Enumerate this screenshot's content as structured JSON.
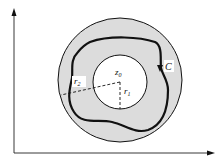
{
  "diagram": {
    "type": "annulus-contour",
    "labels": {
      "center": "z",
      "center_sub": "0",
      "inner_radius": "r",
      "inner_radius_sub": "1",
      "outer_radius": "r",
      "outer_radius_sub": "2",
      "contour": "C"
    },
    "colors": {
      "annulus_fill": "#dcdcdc",
      "inner_fill": "#ffffff",
      "stroke": "#111111"
    },
    "axes": {
      "x_arrow": true,
      "y_arrow": true
    }
  }
}
